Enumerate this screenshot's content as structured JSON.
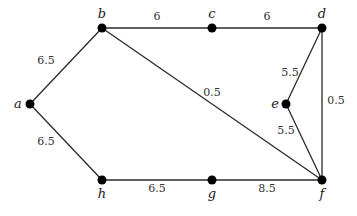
{
  "graph": {
    "type": "weighted-undirected-graph",
    "nodes": [
      {
        "id": "a",
        "label": "a"
      },
      {
        "id": "b",
        "label": "b"
      },
      {
        "id": "c",
        "label": "c"
      },
      {
        "id": "d",
        "label": "d"
      },
      {
        "id": "e",
        "label": "e"
      },
      {
        "id": "f",
        "label": "f"
      },
      {
        "id": "g",
        "label": "g"
      },
      {
        "id": "h",
        "label": "h"
      }
    ],
    "edges": [
      {
        "from": "a",
        "to": "b",
        "weight": "6.5"
      },
      {
        "from": "b",
        "to": "c",
        "weight": "6"
      },
      {
        "from": "c",
        "to": "d",
        "weight": "6"
      },
      {
        "from": "b",
        "to": "f",
        "weight": "0.5"
      },
      {
        "from": "d",
        "to": "e",
        "weight": "5.5"
      },
      {
        "from": "d",
        "to": "f",
        "weight": "0.5"
      },
      {
        "from": "e",
        "to": "f",
        "weight": "5.5"
      },
      {
        "from": "a",
        "to": "h",
        "weight": "6.5"
      },
      {
        "from": "h",
        "to": "g",
        "weight": "6.5"
      },
      {
        "from": "g",
        "to": "f",
        "weight": "8.5"
      }
    ]
  }
}
